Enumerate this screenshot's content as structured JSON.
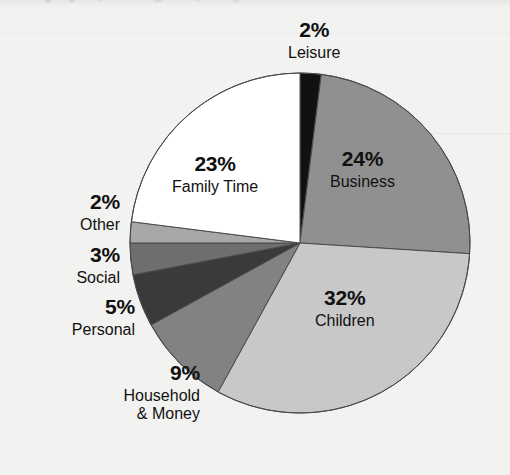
{
  "chart_data": {
    "type": "pie",
    "title": "",
    "subtitle": "",
    "xlabel": "",
    "ylabel": "",
    "legend_position": "none",
    "grid": false,
    "units": "percent",
    "total": 100,
    "start_angle_deg": 0,
    "direction": "clockwise",
    "categories": [
      "Leisure",
      "Business",
      "Children",
      "Household & Money",
      "Personal",
      "Social",
      "Other",
      "Family Time"
    ],
    "values": [
      2,
      24,
      32,
      9,
      5,
      3,
      2,
      23
    ],
    "slices": [
      {
        "label": "Leisure",
        "value": 2,
        "percent_text": "2%",
        "color": "#111111",
        "label_placement": "outside-top",
        "label_lines": [
          "Leisure"
        ]
      },
      {
        "label": "Business",
        "value": 24,
        "percent_text": "24%",
        "color": "#909090",
        "label_placement": "inside",
        "label_lines": [
          "Business"
        ]
      },
      {
        "label": "Children",
        "value": 32,
        "percent_text": "32%",
        "color": "#c8c8c8",
        "label_placement": "inside",
        "label_lines": [
          "Children"
        ]
      },
      {
        "label": "Household & Money",
        "value": 9,
        "percent_text": "9%",
        "color": "#828282",
        "label_placement": "outside-left",
        "label_lines": [
          "Household",
          "& Money"
        ]
      },
      {
        "label": "Personal",
        "value": 5,
        "percent_text": "5%",
        "color": "#3a3a3a",
        "label_placement": "outside-left",
        "label_lines": [
          "Personal"
        ]
      },
      {
        "label": "Social",
        "value": 3,
        "percent_text": "3%",
        "color": "#6e6e6e",
        "label_placement": "outside-left",
        "label_lines": [
          "Social"
        ]
      },
      {
        "label": "Other",
        "value": 2,
        "percent_text": "2%",
        "color": "#a8a8a8",
        "label_placement": "outside-left",
        "label_lines": [
          "Other"
        ]
      },
      {
        "label": "Family Time",
        "value": 23,
        "percent_text": "23%",
        "color": "#ffffff",
        "label_placement": "inside",
        "label_lines": [
          "Family Time"
        ]
      }
    ],
    "geometry": {
      "center_x": 300,
      "center_y": 243,
      "radius": 170,
      "stroke_color": "#4a4a4a",
      "stroke_width": 1
    },
    "colors": {
      "background": "#f2f2f0",
      "text": "#111111",
      "outline": "#4a4a4a"
    }
  },
  "labels": {
    "leisure": {
      "pct": "2%",
      "name": "Leisure"
    },
    "business": {
      "pct": "24%",
      "name": "Business"
    },
    "children": {
      "pct": "32%",
      "name": "Children"
    },
    "familytime": {
      "pct": "23%",
      "name": "Family Time"
    },
    "other": {
      "pct": "2%",
      "name": "Other"
    },
    "social": {
      "pct": "3%",
      "name": "Social"
    },
    "personal": {
      "pct": "5%",
      "name": "Personal"
    },
    "household": {
      "pct": "9%",
      "name_line1": "Household",
      "name_line2": "& Money"
    }
  }
}
